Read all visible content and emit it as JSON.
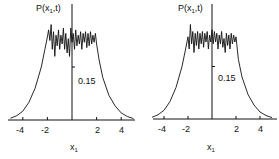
{
  "chart_data": [
    {
      "type": "line",
      "title": "",
      "ylabel": "P(x1,t)",
      "xlabel": "x1",
      "ytick_label": "0.15",
      "xticks": [
        -4,
        -2,
        2,
        4
      ],
      "xtick_labels": [
        "-4",
        "-2",
        "2",
        "4"
      ],
      "xlim": [
        -5,
        5
      ],
      "ylim": [
        0,
        0.3
      ],
      "grid": false,
      "x": [
        -5.0,
        -4.5,
        -4.0,
        -3.5,
        -3.0,
        -2.5,
        -2.2,
        -2.0,
        -1.9,
        -1.8,
        -1.7,
        -1.6,
        -1.5,
        -1.4,
        -1.3,
        -1.2,
        -1.1,
        -1.0,
        -0.9,
        -0.8,
        -0.7,
        -0.6,
        -0.5,
        -0.4,
        -0.3,
        -0.2,
        -0.1,
        0.0,
        0.1,
        0.2,
        0.3,
        0.4,
        0.5,
        0.6,
        0.7,
        0.8,
        0.9,
        1.0,
        1.1,
        1.2,
        1.3,
        1.4,
        1.5,
        1.6,
        1.7,
        1.8,
        1.9,
        2.0,
        2.2,
        2.5,
        3.0,
        3.5,
        4.0,
        4.5,
        5.0
      ],
      "y": [
        0.005,
        0.012,
        0.025,
        0.05,
        0.09,
        0.15,
        0.2,
        0.235,
        0.255,
        0.225,
        0.27,
        0.2,
        0.25,
        0.18,
        0.24,
        0.21,
        0.255,
        0.2,
        0.24,
        0.215,
        0.26,
        0.2,
        0.245,
        0.19,
        0.23,
        0.18,
        0.26,
        0.22,
        0.245,
        0.2,
        0.255,
        0.21,
        0.24,
        0.215,
        0.25,
        0.2,
        0.245,
        0.22,
        0.25,
        0.205,
        0.245,
        0.21,
        0.25,
        0.215,
        0.24,
        0.22,
        0.245,
        0.215,
        0.17,
        0.12,
        0.07,
        0.04,
        0.02,
        0.01,
        0.004
      ]
    },
    {
      "type": "line",
      "title": "",
      "ylabel": "P(x1,t)",
      "xlabel": "x1",
      "ytick_label": "0.15",
      "xticks": [
        -4,
        -2,
        2,
        4
      ],
      "xtick_labels": [
        "-4",
        "-2",
        "2",
        "4"
      ],
      "xlim": [
        -5,
        5
      ],
      "ylim": [
        0,
        0.3
      ],
      "grid": false,
      "x": [
        -5.0,
        -4.5,
        -4.0,
        -3.5,
        -3.0,
        -2.5,
        -2.2,
        -2.0,
        -1.9,
        -1.8,
        -1.7,
        -1.6,
        -1.5,
        -1.4,
        -1.3,
        -1.2,
        -1.1,
        -1.0,
        -0.9,
        -0.8,
        -0.7,
        -0.6,
        -0.5,
        -0.4,
        -0.3,
        -0.2,
        -0.1,
        0.0,
        0.1,
        0.2,
        0.3,
        0.4,
        0.5,
        0.6,
        0.7,
        0.8,
        0.9,
        1.0,
        1.1,
        1.2,
        1.3,
        1.4,
        1.5,
        1.6,
        1.7,
        1.8,
        1.9,
        2.0,
        2.2,
        2.5,
        3.0,
        3.5,
        4.0,
        4.5,
        5.0
      ],
      "y": [
        0.005,
        0.012,
        0.025,
        0.05,
        0.09,
        0.15,
        0.2,
        0.235,
        0.2,
        0.27,
        0.215,
        0.25,
        0.19,
        0.245,
        0.21,
        0.25,
        0.2,
        0.245,
        0.215,
        0.25,
        0.205,
        0.245,
        0.22,
        0.25,
        0.2,
        0.24,
        0.22,
        0.255,
        0.215,
        0.25,
        0.22,
        0.245,
        0.2,
        0.24,
        0.215,
        0.25,
        0.205,
        0.23,
        0.19,
        0.245,
        0.21,
        0.24,
        0.2,
        0.245,
        0.215,
        0.24,
        0.22,
        0.235,
        0.17,
        0.12,
        0.07,
        0.04,
        0.02,
        0.01,
        0.004
      ]
    }
  ],
  "panels": [
    {
      "ylabel_main": "P(x",
      "ylabel_sub": "1",
      "ylabel_tail": ",t)",
      "ytick": "0.15",
      "ticks": [
        "-4",
        "-2",
        "2",
        "4"
      ],
      "xlabel_main": "x",
      "xlabel_sub": "1"
    },
    {
      "ylabel_main": "P(x",
      "ylabel_sub": "1",
      "ylabel_tail": ",t)",
      "ytick": "0.15",
      "ticks": [
        "-4",
        "-2",
        "2",
        "4"
      ],
      "xlabel_main": "x",
      "xlabel_sub": "1"
    }
  ]
}
